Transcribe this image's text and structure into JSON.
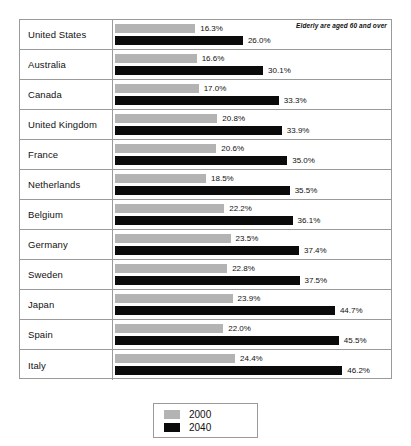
{
  "note": "Elderly are aged 60 and over",
  "legend": {
    "items": [
      {
        "label": "2000",
        "color": "#b3b3b3"
      },
      {
        "label": "2040",
        "color": "#0b0b0b"
      }
    ]
  },
  "chart_data": {
    "type": "bar",
    "orientation": "horizontal",
    "title": "",
    "subtitle": "",
    "annotation": "Elderly are aged 60 and over",
    "xlabel": "",
    "ylabel": "",
    "grid": false,
    "legend_position": "bottom",
    "xlim": [
      0,
      50
    ],
    "value_suffix": "%",
    "categories": [
      "United States",
      "Australia",
      "Canada",
      "United Kingdom",
      "France",
      "Netherlands",
      "Belgium",
      "Germany",
      "Sweden",
      "Japan",
      "Spain",
      "Italy"
    ],
    "series": [
      {
        "name": "2000",
        "color": "#b3b3b3",
        "values": [
          16.3,
          16.6,
          17.0,
          20.8,
          20.6,
          18.5,
          22.2,
          23.5,
          22.8,
          23.9,
          22.0,
          24.4
        ],
        "labels": [
          "16.3%",
          "16.6%",
          "17.0%",
          "20.8%",
          "20.6%",
          "18.5%",
          "22.2%",
          "23.5%",
          "22.8%",
          "23.9%",
          "22.0%",
          "24.4%"
        ]
      },
      {
        "name": "2040",
        "color": "#0b0b0b",
        "values": [
          26.0,
          30.1,
          33.3,
          33.9,
          35.0,
          35.5,
          36.1,
          37.4,
          37.5,
          44.7,
          45.5,
          46.2
        ],
        "labels": [
          "26.0%",
          "30.1%",
          "33.3%",
          "33.9%",
          "35.0%",
          "35.5%",
          "36.1%",
          "37.4%",
          "37.5%",
          "44.7%",
          "45.5%",
          "46.2%"
        ]
      }
    ]
  }
}
